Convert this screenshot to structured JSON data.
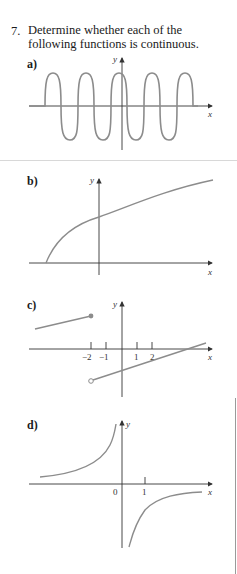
{
  "question": {
    "number": "7.",
    "text": "Determine whether each of the following functions is continuous."
  },
  "panels": [
    {
      "label": "a)",
      "x_axis": "x",
      "y_axis": "y",
      "description": "periodic wave, flat on x-axis at both ends"
    },
    {
      "label": "b)",
      "x_axis": "x",
      "y_axis": "y",
      "description": "square-root-like curve starting on x-axis"
    },
    {
      "label": "c)",
      "x_axis": "x",
      "y_axis": "y",
      "ticks": [
        "−2",
        "−1",
        "1",
        "2"
      ],
      "description": "jump discontinuity at x = -2: closed dot on upper segment, open dot on lower line"
    },
    {
      "label": "d)",
      "x_axis": "x",
      "y_axis": "y",
      "ticks": [
        "0",
        "1"
      ],
      "description": "hyperbola-like curve with vertical asymptote near x = 0"
    }
  ],
  "colors": {
    "curve": "#8c8c8c",
    "axis": "#333333",
    "text": "#1a1a1a",
    "separator": "#d8d8d8"
  }
}
